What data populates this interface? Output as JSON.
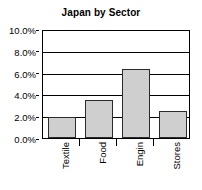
{
  "chart_data": {
    "type": "bar",
    "title": "Japan by Sector",
    "xlabel": "",
    "ylabel": "",
    "categories": [
      "Textile",
      "Food",
      "Engin",
      "Stores"
    ],
    "values": [
      1.9,
      3.5,
      6.3,
      2.5
    ],
    "value_suffix": "%",
    "ylim": [
      0,
      10
    ],
    "ytick_labels": [
      "10.0%",
      "8.0%",
      "6.0%",
      "4.0%",
      "2.0%",
      "0.0%"
    ],
    "ytick_values": [
      10,
      8,
      6,
      4,
      2,
      0
    ],
    "grid": true,
    "grid_orientation": "horizontal",
    "legend": false,
    "bar_fill_color": "#cfcfcf",
    "bar_edge_color": "#2b2b2b",
    "axis_color": "#000000",
    "background_color": "#ffffff",
    "xtick_label_rotation": -90
  }
}
